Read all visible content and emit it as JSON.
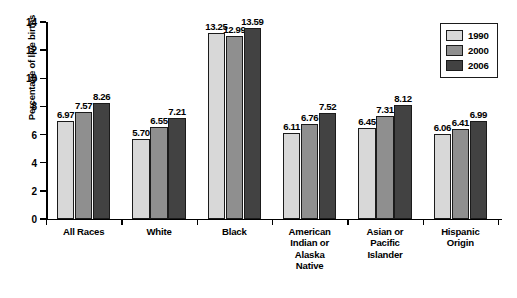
{
  "chart_data": {
    "type": "bar",
    "title": "",
    "xlabel": "",
    "ylabel": "Percentage of live births",
    "ylim": [
      0,
      14
    ],
    "yticks": [
      "0",
      "2",
      "4",
      "6",
      "8",
      "10",
      "12",
      "14"
    ],
    "grid": false,
    "legend_position": "top-right",
    "categories": [
      "All Races",
      "White",
      "Black",
      "American Indian or Alaska Native",
      "Asian or Pacific Islander",
      "Hispanic Origin"
    ],
    "category_lines": [
      [
        "All Races"
      ],
      [
        "White"
      ],
      [
        "Black"
      ],
      [
        "American",
        "Indian or",
        "Alaska",
        "Native"
      ],
      [
        "Asian or",
        "Pacific",
        "Islander"
      ],
      [
        "Hispanic",
        "Origin"
      ]
    ],
    "series": [
      {
        "name": "1990",
        "color": "#d8d8d8",
        "values": [
          6.97,
          5.7,
          13.25,
          6.11,
          6.45,
          6.06
        ],
        "labels": [
          "6.97",
          "5.70",
          "13.25",
          "6.11",
          "6.45",
          "6.06"
        ]
      },
      {
        "name": "2000",
        "color": "#8f8f8f",
        "values": [
          7.57,
          6.55,
          12.99,
          6.76,
          7.31,
          6.41
        ],
        "labels": [
          "7.57",
          "6.55",
          "12.99",
          "6.76",
          "7.31",
          "6.41"
        ]
      },
      {
        "name": "2006",
        "color": "#424242",
        "values": [
          8.26,
          7.21,
          13.59,
          7.52,
          8.12,
          6.99
        ],
        "labels": [
          "8.26",
          "7.21",
          "13.59",
          "7.52",
          "8.12",
          "6.99"
        ]
      }
    ]
  },
  "legend": {
    "items": [
      {
        "label": "1990",
        "color": "#d8d8d8"
      },
      {
        "label": "2000",
        "color": "#8f8f8f"
      },
      {
        "label": "2006",
        "color": "#424242"
      }
    ]
  }
}
